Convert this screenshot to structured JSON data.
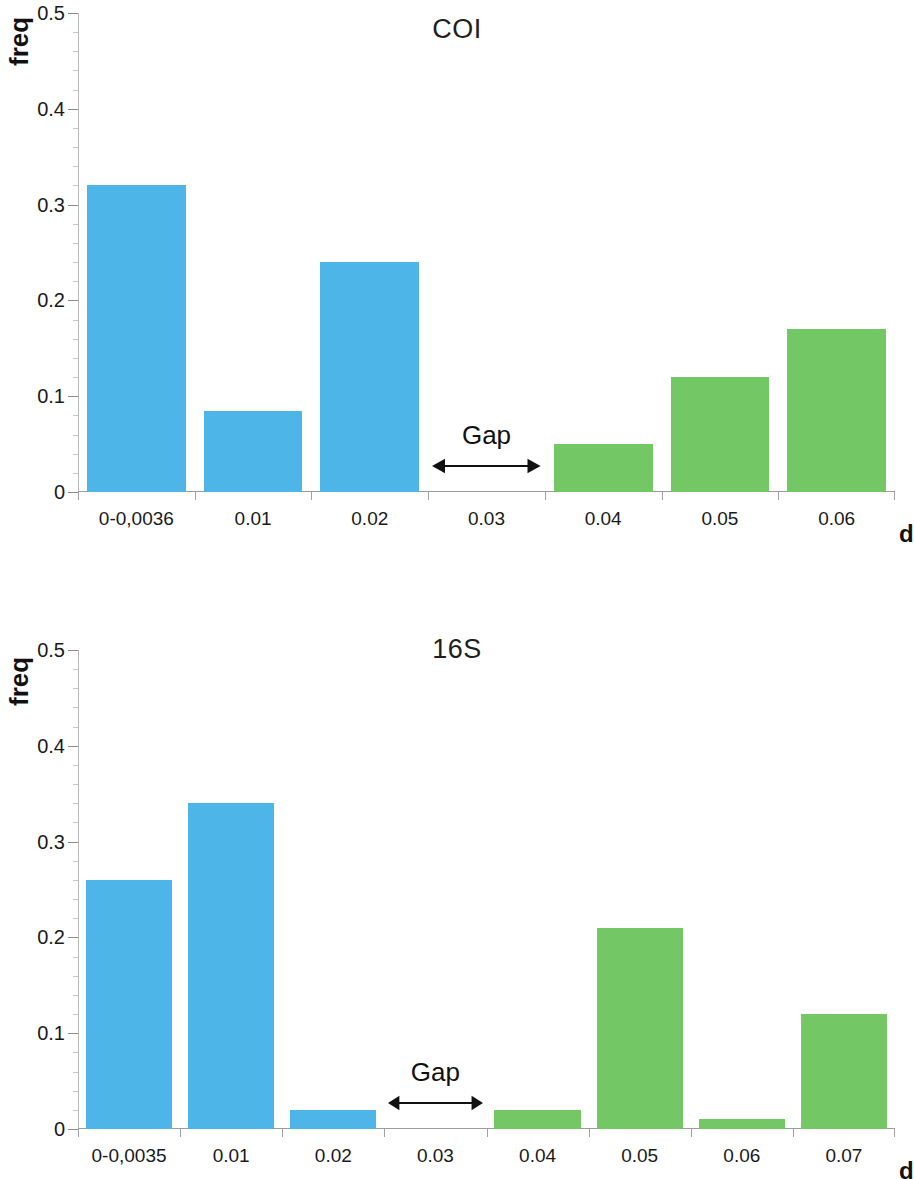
{
  "figure": {
    "colors": {
      "blue": "#4EB5E8",
      "green": "#73C765",
      "axis": "#9c9c9c",
      "text": "#1a1a1a"
    }
  },
  "charts": [
    {
      "id": "coi",
      "title": "COI",
      "ylabel": "freq",
      "xlabel": "d",
      "gap_label": "Gap"
    },
    {
      "id": "16s",
      "title": "16S",
      "ylabel": "freq",
      "xlabel": "d",
      "gap_label": "Gap"
    }
  ],
  "chart_data": [
    {
      "type": "bar",
      "title": "COI",
      "xlabel": "d",
      "ylabel": "freq",
      "ylim": [
        0,
        0.5
      ],
      "ytick_labels": [
        "0",
        "0.1",
        "0.2",
        "0.3",
        "0.4",
        "0.5"
      ],
      "ytick_values": [
        0,
        0.1,
        0.2,
        0.3,
        0.4,
        0.5
      ],
      "grid": false,
      "legend": "none",
      "categories": [
        "0-0,0036",
        "0.01",
        "0.02",
        "0.03",
        "0.04",
        "0.05",
        "0.06"
      ],
      "values": [
        0.32,
        0.085,
        0.24,
        0.0,
        0.05,
        0.12,
        0.17
      ],
      "bar_colors": [
        "#4EB5E8",
        "#4EB5E8",
        "#4EB5E8",
        "#4EB5E8",
        "#73C765",
        "#73C765",
        "#73C765"
      ],
      "annotations": [
        {
          "text": "Gap",
          "type": "double-arrow",
          "from_category": "0.03",
          "span_categories": [
            "0.02",
            "0.04"
          ]
        }
      ]
    },
    {
      "type": "bar",
      "title": "16S",
      "xlabel": "d",
      "ylabel": "freq",
      "ylim": [
        0,
        0.5
      ],
      "ytick_labels": [
        "0",
        "0.1",
        "0.2",
        "0.3",
        "0.4",
        "0.5"
      ],
      "ytick_values": [
        0,
        0.1,
        0.2,
        0.3,
        0.4,
        0.5
      ],
      "grid": false,
      "legend": "none",
      "categories": [
        "0-0,0035",
        "0.01",
        "0.02",
        "0.03",
        "0.04",
        "0.05",
        "0.06",
        "0.07"
      ],
      "values": [
        0.26,
        0.34,
        0.02,
        0.0,
        0.02,
        0.21,
        0.01,
        0.12
      ],
      "bar_colors": [
        "#4EB5E8",
        "#4EB5E8",
        "#4EB5E8",
        "#4EB5E8",
        "#73C765",
        "#73C765",
        "#73C765",
        "#73C765"
      ],
      "annotations": [
        {
          "text": "Gap",
          "type": "double-arrow",
          "from_category": "0.03",
          "span_categories": [
            "0.02",
            "0.04"
          ]
        }
      ]
    }
  ]
}
